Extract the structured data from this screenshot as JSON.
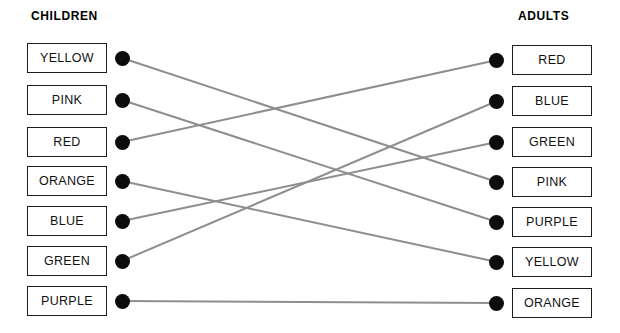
{
  "headings": {
    "left": "CHILDREN",
    "right": "ADULTS"
  },
  "colors": {
    "line": "#8e8e8e",
    "dot": "#0d0d0d",
    "box_border": "#1c1c1c",
    "text": "#111111",
    "background": "#ffffff"
  },
  "left_column": {
    "label": "CHILDREN",
    "items": [
      {
        "label": "YELLOW",
        "y": 58
      },
      {
        "label": "PINK",
        "y": 100
      },
      {
        "label": "RED",
        "y": 142
      },
      {
        "label": "ORANGE",
        "y": 181
      },
      {
        "label": "BLUE",
        "y": 221
      },
      {
        "label": "GREEN",
        "y": 261
      },
      {
        "label": "PURPLE",
        "y": 301
      }
    ]
  },
  "right_column": {
    "label": "ADULTS",
    "items": [
      {
        "label": "RED",
        "y": 60
      },
      {
        "label": "BLUE",
        "y": 101
      },
      {
        "label": "GREEN",
        "y": 142
      },
      {
        "label": "PINK",
        "y": 182
      },
      {
        "label": "PURPLE",
        "y": 222
      },
      {
        "label": "YELLOW",
        "y": 262
      },
      {
        "label": "ORANGE",
        "y": 303
      }
    ]
  },
  "edges": [
    {
      "from": "YELLOW",
      "to": "PINK",
      "x1": 122,
      "y1": 58,
      "x2": 497,
      "y2": 182
    },
    {
      "from": "PINK",
      "to": "PURPLE",
      "x1": 122,
      "y1": 100,
      "x2": 497,
      "y2": 222
    },
    {
      "from": "RED",
      "to": "RED",
      "x1": 122,
      "y1": 142,
      "x2": 497,
      "y2": 60
    },
    {
      "from": "ORANGE",
      "to": "YELLOW",
      "x1": 122,
      "y1": 181,
      "x2": 497,
      "y2": 262
    },
    {
      "from": "BLUE",
      "to": "GREEN",
      "x1": 122,
      "y1": 221,
      "x2": 497,
      "y2": 142
    },
    {
      "from": "GREEN",
      "to": "BLUE",
      "x1": 122,
      "y1": 261,
      "x2": 497,
      "y2": 101
    },
    {
      "from": "PURPLE",
      "to": "ORANGE",
      "x1": 122,
      "y1": 301,
      "x2": 497,
      "y2": 303
    }
  ],
  "geometry": {
    "left_box_x": 27,
    "right_box_x": 512,
    "left_dot_x": 115,
    "right_dot_x": 489,
    "box_width": 80,
    "box_height": 30,
    "dot_size": 15
  }
}
